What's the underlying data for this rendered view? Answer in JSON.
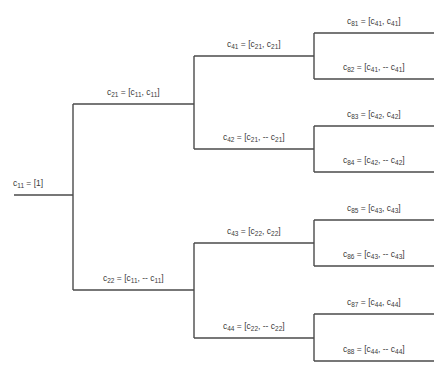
{
  "diagram": {
    "title": "",
    "type": "binary tree (Walsh-Hadamard code construction)",
    "nodes": [
      {
        "id": "c11",
        "level": 1,
        "name": "c",
        "index": "11",
        "eq": "= [1]",
        "parts": []
      },
      {
        "id": "c21",
        "level": 2,
        "parent": "c11",
        "name": "c",
        "index": "21",
        "parts": [
          {
            "s": "",
            "n": "c",
            "i": "11"
          },
          {
            "s": "",
            "n": "c",
            "i": "11"
          }
        ]
      },
      {
        "id": "c22",
        "level": 2,
        "parent": "c11",
        "name": "c",
        "index": "22",
        "parts": [
          {
            "s": "",
            "n": "c",
            "i": "11"
          },
          {
            "s": "-- ",
            "n": "c",
            "i": "11"
          }
        ]
      },
      {
        "id": "c41",
        "level": 3,
        "parent": "c21",
        "name": "c",
        "index": "41",
        "parts": [
          {
            "s": "",
            "n": "c",
            "i": "21"
          },
          {
            "s": "",
            "n": "c",
            "i": "21"
          }
        ]
      },
      {
        "id": "c42",
        "level": 3,
        "parent": "c21",
        "name": "c",
        "index": "42",
        "parts": [
          {
            "s": "",
            "n": "c",
            "i": "21"
          },
          {
            "s": "-- ",
            "n": "c",
            "i": "21"
          }
        ]
      },
      {
        "id": "c43",
        "level": 3,
        "parent": "c22",
        "name": "c",
        "index": "43",
        "parts": [
          {
            "s": "",
            "n": "c",
            "i": "22"
          },
          {
            "s": "",
            "n": "c",
            "i": "22"
          }
        ]
      },
      {
        "id": "c44",
        "level": 3,
        "parent": "c22",
        "name": "c",
        "index": "44",
        "parts": [
          {
            "s": "",
            "n": "c",
            "i": "22"
          },
          {
            "s": "-- ",
            "n": "c",
            "i": "22"
          }
        ]
      },
      {
        "id": "c81",
        "level": 4,
        "parent": "c41",
        "name": "c",
        "index": "81",
        "parts": [
          {
            "s": "",
            "n": "c",
            "i": "41"
          },
          {
            "s": "",
            "n": "c",
            "i": "41"
          }
        ]
      },
      {
        "id": "c82",
        "level": 4,
        "parent": "c41",
        "name": "c",
        "index": "82",
        "parts": [
          {
            "s": "",
            "n": "c",
            "i": "41"
          },
          {
            "s": "-- ",
            "n": "c",
            "i": "41"
          }
        ]
      },
      {
        "id": "c83",
        "level": 4,
        "parent": "c42",
        "name": "c",
        "index": "83",
        "parts": [
          {
            "s": "",
            "n": "c",
            "i": "42"
          },
          {
            "s": "",
            "n": "c",
            "i": "42"
          }
        ]
      },
      {
        "id": "c84",
        "level": 4,
        "parent": "c42",
        "name": "c",
        "index": "84",
        "parts": [
          {
            "s": "",
            "n": "c",
            "i": "42"
          },
          {
            "s": "-- ",
            "n": "c",
            "i": "42"
          }
        ]
      },
      {
        "id": "c85",
        "level": 4,
        "parent": "c43",
        "name": "c",
        "index": "85",
        "parts": [
          {
            "s": "",
            "n": "c",
            "i": "43"
          },
          {
            "s": "",
            "n": "c",
            "i": "43"
          }
        ]
      },
      {
        "id": "c86",
        "level": 4,
        "parent": "c43",
        "name": "c",
        "index": "86",
        "parts": [
          {
            "s": "",
            "n": "c",
            "i": "43"
          },
          {
            "s": "-- ",
            "n": "c",
            "i": "43"
          }
        ]
      },
      {
        "id": "c87",
        "level": 4,
        "parent": "c44",
        "name": "c",
        "index": "87",
        "parts": [
          {
            "s": "",
            "n": "c",
            "i": "44"
          },
          {
            "s": "",
            "n": "c",
            "i": "44"
          }
        ]
      },
      {
        "id": "c88",
        "level": 4,
        "parent": "c44",
        "name": "c",
        "index": "88",
        "parts": [
          {
            "s": "",
            "n": "c",
            "i": "44"
          },
          {
            "s": "-- ",
            "n": "c",
            "i": "44"
          }
        ]
      }
    ]
  }
}
